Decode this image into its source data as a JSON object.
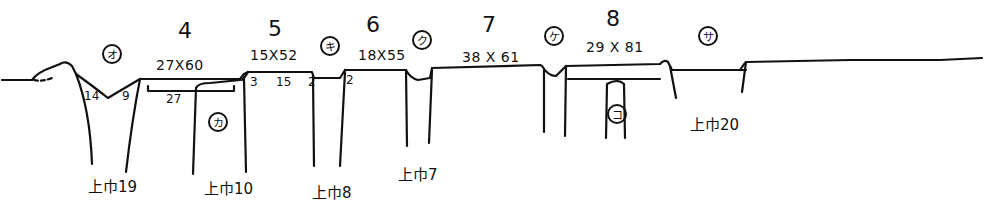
{
  "diagram": {
    "type": "hand-drawn cross-section sketch",
    "sections": [
      {
        "id": "4",
        "number": "4",
        "dimensions": "27X60",
        "sub_width": "27"
      },
      {
        "id": "5",
        "number": "5",
        "dimensions": "15X52",
        "sub_labels": [
          "3",
          "15",
          "2"
        ]
      },
      {
        "id": "6",
        "number": "6",
        "dimensions": "18X55",
        "sub_labels": [
          "2"
        ]
      },
      {
        "id": "7",
        "number": "7",
        "dimensions": "38 X 61"
      },
      {
        "id": "8",
        "number": "8",
        "dimensions": "29 X 81"
      }
    ],
    "circled_markers": [
      {
        "id": "o",
        "label": "オ"
      },
      {
        "id": "ka",
        "label": "カ"
      },
      {
        "id": "ki",
        "label": "キ"
      },
      {
        "id": "ku",
        "label": "ク"
      },
      {
        "id": "ke",
        "label": "ケ"
      },
      {
        "id": "ko",
        "label": "コ"
      },
      {
        "id": "sa",
        "label": "サ"
      }
    ],
    "depth_labels": {
      "left_pit_left": "14",
      "left_pit_right": "9"
    },
    "references": [
      {
        "id": "r19",
        "label": "上巾19"
      },
      {
        "id": "r10",
        "label": "上巾10"
      },
      {
        "id": "r8",
        "label": "上巾8"
      },
      {
        "id": "r7",
        "label": "上巾7"
      },
      {
        "id": "r20",
        "label": "上巾20"
      }
    ]
  }
}
